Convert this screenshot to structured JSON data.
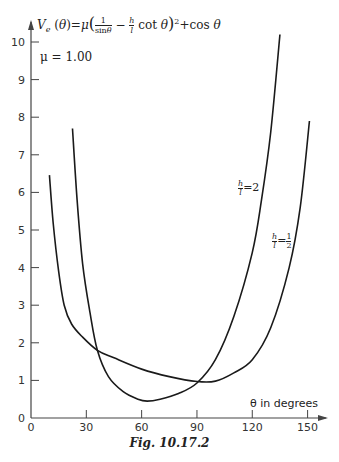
{
  "chart_data": {
    "type": "line",
    "annotations": [
      "μ = 1.00"
    ],
    "xlabel": "θ in degrees",
    "ylabel": "V_e(θ)",
    "xlim": [
      0,
      155
    ],
    "ylim": [
      0,
      10.5
    ],
    "x_ticks": [
      0,
      30,
      60,
      90,
      120,
      150
    ],
    "y_ticks": [
      0,
      1,
      2,
      3,
      4,
      5,
      6,
      7,
      8,
      9,
      10
    ],
    "grid": false,
    "legend": "inline labels",
    "caption": "Fig. 10.17.2",
    "series": [
      {
        "name": "h/l = 1/2",
        "x": [
          10,
          12,
          15,
          18,
          22,
          28,
          36,
          45,
          60,
          75,
          90,
          100,
          110,
          120,
          130,
          140,
          146,
          151
        ],
        "values": [
          6.46,
          5.2,
          3.9,
          3.0,
          2.5,
          2.15,
          1.8,
          1.6,
          1.3,
          1.1,
          0.97,
          0.98,
          1.2,
          1.55,
          2.4,
          4.0,
          5.6,
          7.9
        ]
      },
      {
        "name": "h/l = 2",
        "x": [
          22.5,
          25,
          28,
          32,
          36,
          42,
          50,
          58,
          63,
          70,
          80,
          90,
          100,
          110,
          120,
          125,
          130,
          135
        ],
        "values": [
          7.7,
          5.8,
          4.1,
          2.8,
          1.8,
          1.1,
          0.7,
          0.5,
          0.45,
          0.5,
          0.65,
          0.93,
          1.55,
          2.7,
          4.4,
          5.8,
          7.6,
          10.2
        ]
      }
    ]
  },
  "labels": {
    "formula": "Vₑ(θ)=μ(1/sinθ − h/l cot θ)² + cos θ",
    "mu": "μ = 1.00",
    "xaxis": "θ in degrees",
    "curve_a": "h/l = 2",
    "curve_b": "h/l = 1/2",
    "caption": "Fig. 10.17.2"
  }
}
